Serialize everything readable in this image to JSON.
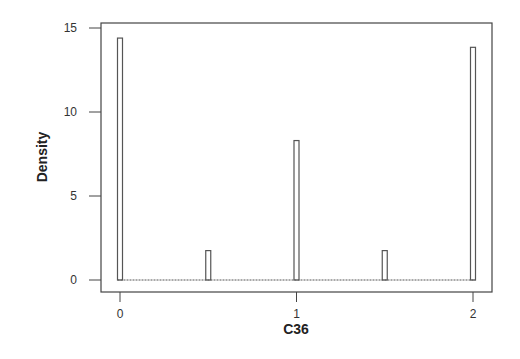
{
  "chart_data": {
    "type": "bar",
    "subtype": "histogram",
    "title": "",
    "xlabel": "C36",
    "ylabel": "Density",
    "x": [
      0,
      0.5,
      1,
      1.5,
      2
    ],
    "values": [
      14.4,
      1.75,
      8.3,
      1.75,
      13.85
    ],
    "bin_width": 0.025,
    "xlim": [
      -0.1,
      2.1
    ],
    "ylim": [
      -0.7,
      15.3
    ],
    "xticks": [
      0,
      1,
      2
    ],
    "xtick_labels": [
      "0",
      "1",
      "2"
    ],
    "yticks": [
      0,
      5,
      10,
      15
    ],
    "ytick_labels": [
      "0",
      "5",
      "10",
      "15"
    ],
    "grid": false,
    "legend": null,
    "bar_fill": "#ffffff",
    "bar_edge": "#555555"
  }
}
